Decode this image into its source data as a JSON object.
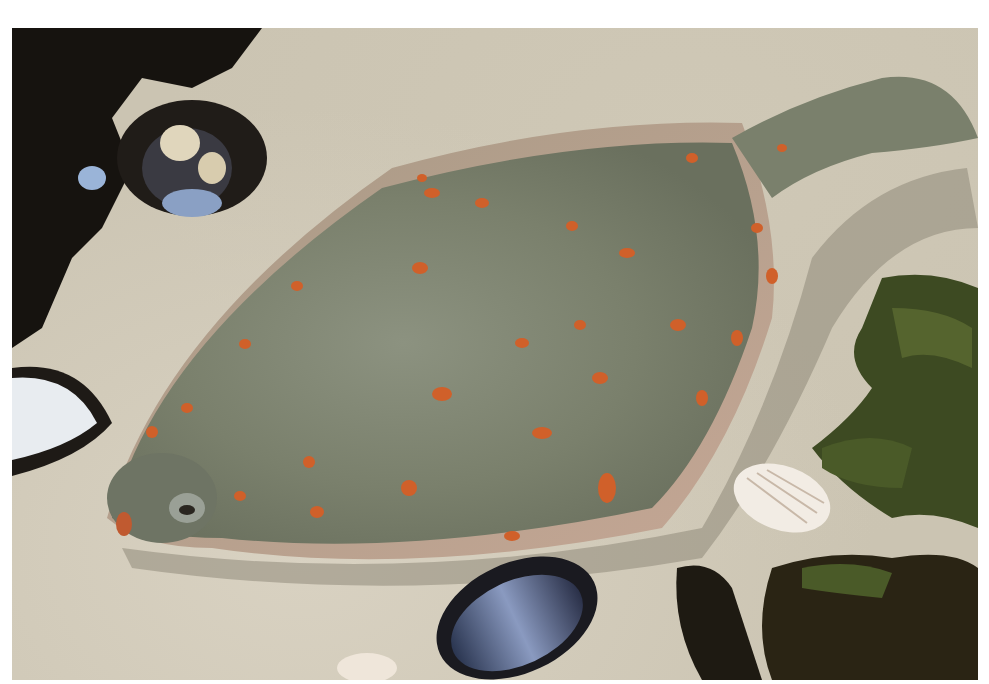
{
  "image": {
    "subject": "plaice flatfish on sand",
    "elements": [
      "fish",
      "shells",
      "seaweed",
      "sand"
    ],
    "colors": {
      "sand": "#cbc4b2",
      "fish_body": "#7d8470",
      "fish_fin": "#b8a590",
      "spots": "#d0602a",
      "seaweed": "#3d4a22",
      "dark_rock": "#1a1612",
      "mussel": "#3a4a6a"
    }
  }
}
